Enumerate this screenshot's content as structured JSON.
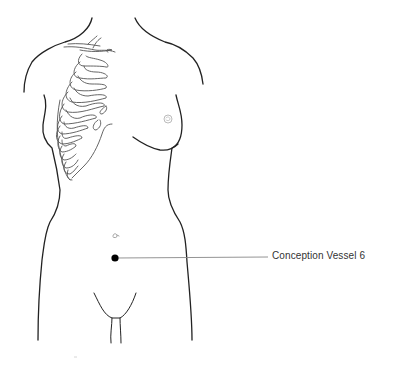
{
  "diagram": {
    "point": {
      "label": "Conception Vessel 6",
      "marker_color": "#000000",
      "leader_color": "#888888"
    }
  }
}
